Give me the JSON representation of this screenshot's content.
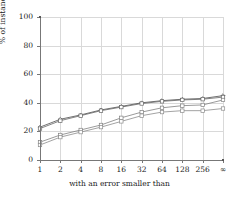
{
  "chart_data": {
    "type": "line",
    "title": "",
    "xlabel": "with an error smaller than",
    "ylabel": "% of instances bounded",
    "x_tick_labels": [
      "1",
      "2",
      "4",
      "8",
      "16",
      "32",
      "64",
      "128",
      "256",
      "∞"
    ],
    "y_tick_labels": [
      "0",
      "20",
      "40",
      "60",
      "80",
      "100"
    ],
    "y_ticks": [
      0,
      20,
      40,
      60,
      80,
      100
    ],
    "ylim": [
      0,
      100
    ],
    "grid": true,
    "legend": "none",
    "categories": [
      "1",
      "2",
      "4",
      "8",
      "16",
      "32",
      "64",
      "128",
      "256",
      "∞"
    ],
    "series": [
      {
        "name": "series-1",
        "marker": "diamond",
        "color": "#4d4d4d",
        "values": [
          23,
          28.5,
          31.5,
          35,
          37.5,
          40,
          41.5,
          42.5,
          43,
          45
        ]
      },
      {
        "name": "series-2",
        "marker": "square",
        "color": "#666666",
        "values": [
          22,
          27.5,
          31,
          34.5,
          37,
          39.5,
          41,
          42,
          42.5,
          44
        ]
      },
      {
        "name": "series-3",
        "marker": "square",
        "color": "#808080",
        "values": [
          12.5,
          17.5,
          21,
          24.5,
          29.5,
          33.5,
          36.5,
          38,
          38.5,
          42
        ]
      },
      {
        "name": "series-4",
        "marker": "square",
        "color": "#8c8c8c",
        "values": [
          10.5,
          16,
          19.5,
          23,
          27,
          31,
          33.5,
          34.5,
          34.5,
          36
        ]
      }
    ]
  },
  "axes": {
    "y_label": "% of instances bounded",
    "x_label": "with an error smaller than",
    "y_tick_0": "0",
    "y_tick_1": "20",
    "y_tick_2": "40",
    "y_tick_3": "60",
    "y_tick_4": "80",
    "y_tick_5": "100",
    "x_tick_0": "1",
    "x_tick_1": "2",
    "x_tick_2": "4",
    "x_tick_3": "8",
    "x_tick_4": "16",
    "x_tick_5": "32",
    "x_tick_6": "64",
    "x_tick_7": "128",
    "x_tick_8": "256",
    "x_tick_9": "∞"
  }
}
